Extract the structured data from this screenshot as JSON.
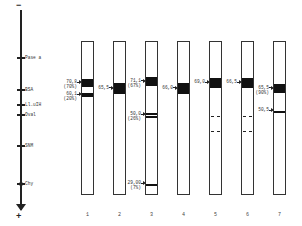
{
  "axis": {
    "top_sign": "−",
    "bottom_sign": "+",
    "markers": [
      {
        "label": "Pase a",
        "y": 57
      },
      {
        "label": "BSA",
        "y": 89
      },
      {
        "label": "Ll.uIH",
        "y": 104
      },
      {
        "label": "Oval",
        "y": 114
      },
      {
        "label": "SNM",
        "y": 145
      },
      {
        "label": "Chy",
        "y": 183
      }
    ]
  },
  "lanes": [
    {
      "number": "1",
      "x": 81,
      "bands": [
        {
          "type": "solid",
          "top": 78,
          "height": 8,
          "label": "70,8",
          "sublabel": "(70%)"
        },
        {
          "type": "solid",
          "top": 92,
          "height": 4,
          "label": "60,1",
          "sublabel": "(20%)"
        }
      ]
    },
    {
      "number": "2",
      "x": 113,
      "bands": [
        {
          "type": "solid",
          "top": 82,
          "height": 11,
          "label": "65,5",
          "sublabel": ""
        }
      ]
    },
    {
      "number": "3",
      "x": 145,
      "bands": [
        {
          "type": "solid",
          "top": 76,
          "height": 9,
          "label": "71,1",
          "sublabel": "(67%)"
        },
        {
          "type": "double",
          "top": 112,
          "height": 4,
          "label": "50,0",
          "sublabel": "(26%)"
        },
        {
          "type": "thin",
          "top": 183,
          "height": 1.5,
          "label": "29,00",
          "sublabel": "(7%)"
        }
      ]
    },
    {
      "number": "4",
      "x": 177,
      "bands": [
        {
          "type": "solid",
          "top": 82,
          "height": 11,
          "label": "66,0",
          "sublabel": ""
        }
      ]
    },
    {
      "number": "5",
      "x": 209,
      "bands": [
        {
          "type": "solid",
          "top": 77,
          "height": 10,
          "label": "69,0",
          "sublabel": ""
        },
        {
          "type": "dashed",
          "top": 115
        },
        {
          "type": "dashed",
          "top": 130
        }
      ]
    },
    {
      "number": "6",
      "x": 241,
      "bands": [
        {
          "type": "solid",
          "top": 77,
          "height": 10,
          "label": "66,5",
          "sublabel": ""
        },
        {
          "type": "dashed",
          "top": 115
        },
        {
          "type": "dashed",
          "top": 130
        }
      ]
    },
    {
      "number": "7",
      "x": 273,
      "bands": [
        {
          "type": "solid",
          "top": 83,
          "height": 9,
          "label": "65,5",
          "sublabel": "(90%)"
        },
        {
          "type": "thin",
          "top": 110,
          "height": 1.5,
          "label": "50,5",
          "sublabel": ""
        }
      ]
    }
  ]
}
